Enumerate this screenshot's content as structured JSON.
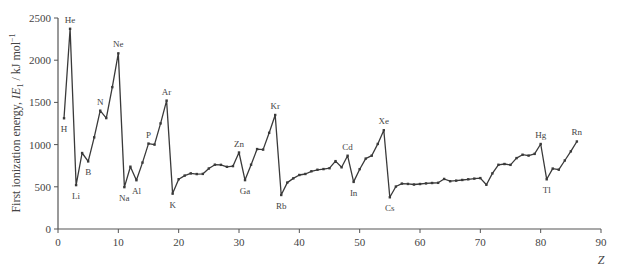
{
  "chart_data": {
    "type": "line",
    "title": "",
    "xlabel": "Z",
    "ylabel": "First ionization energy, IE1 / kJ mol-1",
    "ylabel_parts": {
      "pre": "First ionization energy, ",
      "italic": "IE",
      "sub": "1",
      "post": " / kJ mol",
      "sup": "−1"
    },
    "xlim": [
      0,
      90
    ],
    "ylim": [
      0,
      2500
    ],
    "xticks": [
      0,
      10,
      20,
      30,
      40,
      50,
      60,
      70,
      80,
      90
    ],
    "yticks": [
      0,
      500,
      1000,
      1500,
      2000,
      2500
    ],
    "grid": false,
    "legend": null,
    "x": [
      1,
      2,
      3,
      4,
      5,
      6,
      7,
      8,
      9,
      10,
      11,
      12,
      13,
      14,
      15,
      16,
      17,
      18,
      19,
      20,
      21,
      22,
      23,
      24,
      25,
      26,
      27,
      28,
      29,
      30,
      31,
      32,
      33,
      34,
      35,
      36,
      37,
      38,
      39,
      40,
      41,
      42,
      43,
      44,
      45,
      46,
      47,
      48,
      49,
      50,
      51,
      52,
      53,
      54,
      55,
      56,
      57,
      58,
      59,
      60,
      61,
      62,
      63,
      64,
      65,
      66,
      67,
      68,
      69,
      70,
      71,
      72,
      73,
      74,
      75,
      76,
      77,
      78,
      79,
      80,
      81,
      82,
      83,
      84,
      85,
      86
    ],
    "values": [
      1312,
      2372,
      520,
      900,
      801,
      1086,
      1402,
      1314,
      1681,
      2081,
      496,
      738,
      578,
      787,
      1012,
      1000,
      1251,
      1521,
      419,
      590,
      633,
      659,
      651,
      653,
      717,
      762,
      760,
      737,
      745,
      906,
      579,
      762,
      947,
      941,
      1140,
      1351,
      403,
      550,
      600,
      640,
      652,
      684,
      702,
      710,
      720,
      804,
      731,
      868,
      558,
      709,
      834,
      869,
      1008,
      1170,
      376,
      503,
      538,
      534,
      527,
      533,
      540,
      545,
      547,
      593,
      566,
      573,
      581,
      589,
      597,
      603,
      524,
      659,
      761,
      770,
      760,
      840,
      880,
      870,
      890,
      1007,
      589,
      716,
      703,
      812,
      920,
      1037
    ],
    "annotations": [
      {
        "label": "H",
        "z": 1,
        "pos": "below"
      },
      {
        "label": "He",
        "z": 2,
        "pos": "above"
      },
      {
        "label": "Li",
        "z": 3,
        "pos": "below"
      },
      {
        "label": "B",
        "z": 5,
        "pos": "below"
      },
      {
        "label": "N",
        "z": 7,
        "pos": "above"
      },
      {
        "label": "Ne",
        "z": 10,
        "pos": "above"
      },
      {
        "label": "Na",
        "z": 11,
        "pos": "below"
      },
      {
        "label": "Al",
        "z": 13,
        "pos": "below"
      },
      {
        "label": "P",
        "z": 15,
        "pos": "above"
      },
      {
        "label": "Ar",
        "z": 18,
        "pos": "above"
      },
      {
        "label": "K",
        "z": 19,
        "pos": "below"
      },
      {
        "label": "Zn",
        "z": 30,
        "pos": "above"
      },
      {
        "label": "Ga",
        "z": 31,
        "pos": "below"
      },
      {
        "label": "Kr",
        "z": 36,
        "pos": "above"
      },
      {
        "label": "Rb",
        "z": 37,
        "pos": "below"
      },
      {
        "label": "Cd",
        "z": 48,
        "pos": "above"
      },
      {
        "label": "In",
        "z": 49,
        "pos": "below"
      },
      {
        "label": "Xe",
        "z": 54,
        "pos": "above"
      },
      {
        "label": "Cs",
        "z": 55,
        "pos": "below"
      },
      {
        "label": "Hg",
        "z": 80,
        "pos": "above"
      },
      {
        "label": "Tl",
        "z": 81,
        "pos": "below"
      },
      {
        "label": "Rn",
        "z": 86,
        "pos": "above"
      }
    ],
    "colors": {
      "line": "#3a3a3a",
      "axis": "#555555",
      "text": "#444444"
    }
  }
}
